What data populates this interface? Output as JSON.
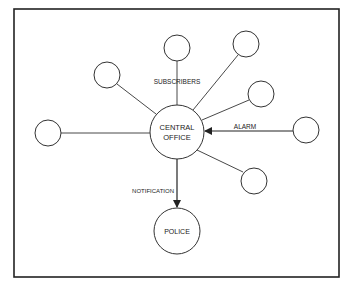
{
  "diagram": {
    "central_node": {
      "label_line1": "CENTRAL",
      "label_line2": "OFFICE"
    },
    "police_node": {
      "label": "POLICE"
    },
    "edge_labels": {
      "subscribers": "SUBSCRIBERS",
      "alarm": "ALARM",
      "notification": "NOTIFICATION"
    },
    "subscriber_count": 7
  }
}
